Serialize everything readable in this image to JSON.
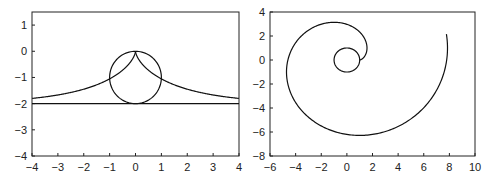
{
  "chart_data": [
    {
      "type": "line",
      "title": "",
      "xlabel": "",
      "ylabel": "",
      "xlim": [
        -4,
        4
      ],
      "ylim": [
        -4,
        1.5
      ],
      "xticks": [
        "-4",
        "-3",
        "-2",
        "-1",
        "0",
        "1",
        "2",
        "3",
        "4"
      ],
      "yticks": [
        "1",
        "0",
        "-1",
        "-2",
        "-3",
        "-4"
      ],
      "grid": false,
      "series": [
        {
          "name": "circle",
          "description": "circle centered (0,-1) radius 1"
        },
        {
          "name": "tractrix",
          "description": "symmetric tractrix cusp at (0,0), asymptote y=-2",
          "points": [
            [
              -4,
              -1.72
            ],
            [
              -3,
              -1.62
            ],
            [
              -2,
              -1.45
            ],
            [
              -1,
              -1.0
            ],
            [
              0,
              0
            ],
            [
              1,
              -1.0
            ],
            [
              2,
              -1.45
            ],
            [
              3,
              -1.62
            ],
            [
              4,
              -1.72
            ]
          ]
        },
        {
          "name": "asymptote",
          "description": "horizontal line y=-2"
        }
      ]
    },
    {
      "type": "line",
      "title": "",
      "xlabel": "",
      "ylabel": "",
      "xlim": [
        -6,
        10
      ],
      "ylim": [
        -8,
        4
      ],
      "xticks": [
        "-6",
        "-4",
        "-2",
        "0",
        "2",
        "4",
        "6",
        "8",
        "10"
      ],
      "yticks": [
        "4",
        "2",
        "0",
        "-2",
        "-4",
        "-6",
        "-8"
      ],
      "grid": false,
      "series": [
        {
          "name": "unit-circle",
          "description": "circle centered (0,0) radius 1"
        },
        {
          "name": "involute",
          "description": "involute of unit circle starting at (1,0)",
          "points": [
            [
              1,
              0
            ],
            [
              1.6,
              1.2
            ],
            [
              -1,
              3.2
            ],
            [
              -4,
              1.2
            ],
            [
              -4.6,
              -1.5
            ],
            [
              -2,
              -5.4
            ],
            [
              1,
              -6.2
            ],
            [
              5,
              -4.4
            ],
            [
              7.8,
              0.5
            ],
            [
              7.3,
              4
            ]
          ]
        }
      ]
    }
  ]
}
